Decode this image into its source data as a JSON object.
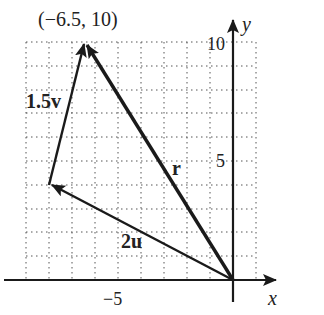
{
  "diagram": {
    "title_point_label": "(−6.5, 10)",
    "axes": {
      "x_label": "x",
      "y_label": "y",
      "x_tick_label": "−5",
      "y_tick_labels": [
        "5",
        "10"
      ]
    },
    "grid": {
      "x_min": -9,
      "x_max": 1,
      "y_min": 0,
      "y_max": 10,
      "step": 1
    },
    "vectors": [
      {
        "name": "2u",
        "label": "2u",
        "from": [
          0,
          0
        ],
        "to": [
          -8,
          4
        ]
      },
      {
        "name": "1.5v",
        "label": "1.5v",
        "from": [
          -8,
          4
        ],
        "to": [
          -6.5,
          10
        ]
      },
      {
        "name": "r",
        "label": "r",
        "from": [
          0,
          0
        ],
        "to": [
          -6.5,
          10
        ]
      }
    ],
    "colors": {
      "ink": "#1a1a1a",
      "grid": "#555555",
      "background": "#ffffff"
    }
  }
}
